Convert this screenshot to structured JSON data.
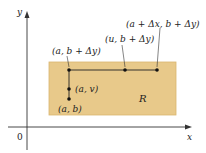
{
  "diagram": {
    "axes": {
      "x_label": "x",
      "y_label": "y",
      "origin_label": "0"
    },
    "region": {
      "label": "R",
      "fill": "#e8c98a",
      "stroke": "#d9b66f"
    },
    "points": [
      {
        "id": "a_b",
        "label": "(a, b)"
      },
      {
        "id": "a_v",
        "label": "(a, v)"
      },
      {
        "id": "a_bdy",
        "label": "(a, b + Δy)"
      },
      {
        "id": "u_bdy",
        "label": "(u, b + Δy)"
      },
      {
        "id": "adx_bdy",
        "label": "(a + Δx, b + Δy)"
      }
    ],
    "colors": {
      "axis": "#333333",
      "path": "#222222",
      "point": "#111111"
    }
  }
}
